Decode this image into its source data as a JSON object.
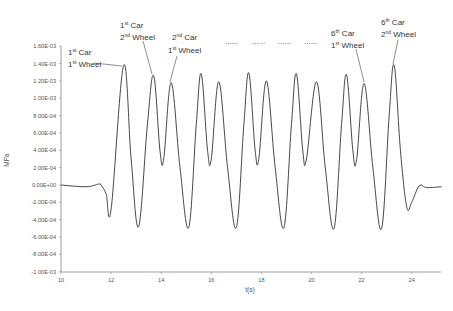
{
  "chart_data": {
    "type": "line",
    "title": "",
    "xlabel": "t(s)",
    "ylabel": "MPa",
    "xlim": [
      10,
      25.2
    ],
    "ylim": [
      -0.001,
      0.0016
    ],
    "grid": false,
    "legend": null,
    "x_ticks": [
      "10",
      "12",
      "14",
      "16",
      "18",
      "20",
      "22",
      "24"
    ],
    "y_ticks": [
      "1.60E-03",
      "1.40E-03",
      "1.20E-03",
      "1.00E-03",
      "8.00E-04",
      "6.00E-04",
      "4.00E-04",
      "2.00E-04",
      "0.00E+00",
      "-2.00E-04",
      "-4.00E-04",
      "-6.00E-04",
      "-8.00E-04",
      "-1.00E-03"
    ],
    "series": [
      {
        "name": "stress",
        "x": [
          10.0,
          11.0,
          11.5,
          11.6,
          11.8,
          12.0,
          12.5,
          12.8,
          13.1,
          13.45,
          13.7,
          13.95,
          14.1,
          14.4,
          14.75,
          15.1,
          15.4,
          15.6,
          15.85,
          16.0,
          16.3,
          16.65,
          17.0,
          17.3,
          17.5,
          17.75,
          17.9,
          18.2,
          18.55,
          18.9,
          19.2,
          19.4,
          19.65,
          19.8,
          20.2,
          20.55,
          20.9,
          21.2,
          21.4,
          21.65,
          21.8,
          22.1,
          22.45,
          22.8,
          23.1,
          23.3,
          23.55,
          23.8,
          24.0,
          24.3,
          24.6,
          25.2
        ],
        "y": [
          0.0,
          -2e-05,
          1e-05,
          0.0,
          -0.0001,
          -0.00028,
          0.00138,
          0.0003,
          -0.00048,
          0.0007,
          0.00126,
          0.0004,
          0.0003,
          0.00118,
          0.0002,
          -0.00049,
          0.0007,
          0.00128,
          0.0004,
          0.0003,
          0.00119,
          0.0002,
          -0.00049,
          0.0007,
          0.00129,
          0.0004,
          0.00031,
          0.0012,
          0.0002,
          -0.00049,
          0.0007,
          0.00128,
          0.0004,
          0.0003,
          0.00119,
          0.0002,
          -0.0005,
          0.0007,
          0.00127,
          0.0004,
          0.00029,
          0.00117,
          0.0002,
          -0.0005,
          0.0008,
          0.00138,
          0.0004,
          -0.00025,
          -0.0002,
          -1e-05,
          -3e-05,
          -2e-05
        ]
      }
    ],
    "annotations": [
      {
        "line1": "1",
        "sup1": "st",
        "word1": " Car",
        "line2": "1",
        "sup2": "st",
        "word2": " Wheel",
        "target_t": 12.5
      },
      {
        "line1": "1",
        "sup1": "st",
        "word1": " Car",
        "line2": "2",
        "sup2": "nd",
        "word2": " Wheel",
        "target_t": 13.7
      },
      {
        "line1": "2",
        "sup1": "nd",
        "word1": " Car",
        "line2": "1",
        "sup2": "st",
        "word2": " Wheel",
        "target_t": 14.4
      },
      {
        "line1": "6",
        "sup1": "th",
        "word1": " Car",
        "line2": "1",
        "sup2": "st",
        "word2": " Wheel",
        "target_t": 22.1
      },
      {
        "line1": "6",
        "sup1": "th",
        "word1": " Car",
        "line2": "2",
        "sup2": "nd",
        "word2": " Wheel",
        "target_t": 23.3
      }
    ],
    "ellipsis": [
      "......",
      "......",
      "......",
      "......"
    ]
  },
  "labels": {
    "ann": [
      {
        "n1": "1",
        "s1": "st",
        "w1": " Car",
        "n2": "1",
        "s2": "st",
        "w2": " Wheel"
      },
      {
        "n1": "1",
        "s1": "st",
        "w1": " Car",
        "n2": "2",
        "s2": "nd",
        "w2": " Wheel"
      },
      {
        "n1": "2",
        "s1": "nd",
        "w1": " Car",
        "n2": "1",
        "s2": "st",
        "w2": " Wheel"
      },
      {
        "n1": "6",
        "s1": "th",
        "w1": " Car",
        "n2": "1",
        "s2": "st",
        "w2": " Wheel"
      },
      {
        "n1": "6",
        "s1": "th",
        "w1": " Car",
        "n2": "2",
        "s2": "nd",
        "w2": " Wheel"
      }
    ],
    "dots": [
      "......",
      "......",
      "......",
      "......"
    ],
    "xlabel": "t(s)",
    "ylabel": "MPa"
  }
}
